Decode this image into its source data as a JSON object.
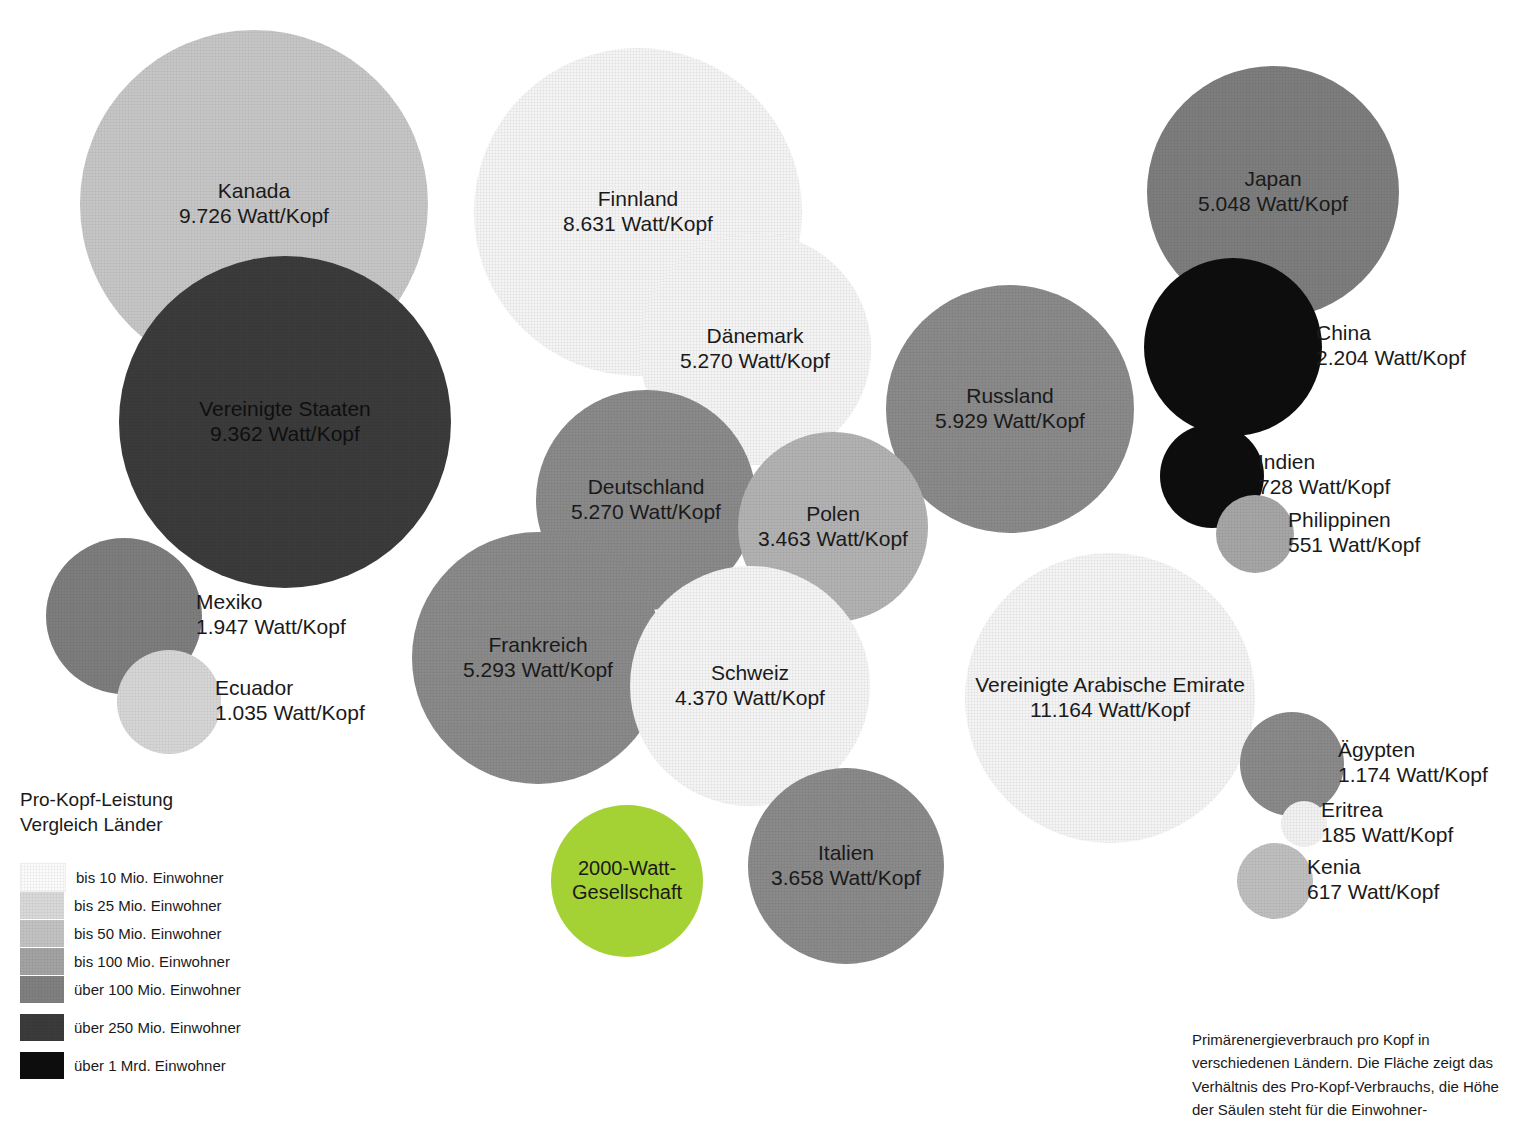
{
  "chart_data": {
    "type": "scatter",
    "title": "Pro-Kopf-Leistung Vergleich Länder",
    "unit_label": "Watt/Kopf",
    "xlabel": "",
    "ylabel": "",
    "grid": false,
    "legend_position": "bottom-left",
    "categories": [
      "Kanada",
      "Finnland",
      "Japan",
      "Vereinigte Staaten",
      "China",
      "Dänemark",
      "Russland",
      "Indien",
      "Deutschland",
      "Polen",
      "Philippinen",
      "Mexiko",
      "Frankreich",
      "Schweiz",
      "Vereinigte Arabische Emirate",
      "Ecuador",
      "Ägypten",
      "Italien",
      "Eritrea",
      "Kenia"
    ],
    "values": [
      9726,
      8631,
      5048,
      9362,
      2204,
      5270,
      5929,
      728,
      5270,
      3463,
      551,
      1947,
      5293,
      4370,
      11164,
      1035,
      1174,
      3658,
      185,
      617
    ],
    "bubbles": [
      {
        "name": "Kanada",
        "value_label": "9.726 Watt/Kopf",
        "value": 9726,
        "population_class": "bis 50 Mio. Einwohner",
        "color": "#c6c6c6",
        "x": 80,
        "y": 30,
        "d": 348,
        "label": "inside",
        "font": 21
      },
      {
        "name": "Finnland",
        "value_label": "8.631 Watt/Kopf",
        "value": 8631,
        "population_class": "bis 10 Mio. Einwohner",
        "color": "#f4f4f4",
        "x": 474,
        "y": 48,
        "d": 328,
        "label": "inside",
        "font": 21
      },
      {
        "name": "Japan",
        "value_label": "5.048 Watt/Kopf",
        "value": 5048,
        "population_class": "über 100 Mio. Einwohner",
        "color": "#7d7d7d",
        "x": 1147,
        "y": 66,
        "d": 252,
        "label": "inside",
        "font": 21
      },
      {
        "name": "Vereinigte Staaten",
        "value_label": "9.362 Watt/Kopf",
        "value": 9362,
        "population_class": "über 250 Mio. Einwohner",
        "color": "#3b3b3b",
        "x": 119,
        "y": 256,
        "d": 332,
        "label": "inside",
        "font": 21,
        "text_color": "#111111"
      },
      {
        "name": "Dänemark",
        "value_label": "5.270 Watt/Kopf",
        "value": 5270,
        "population_class": "bis 10 Mio. Einwohner",
        "color": "#f4f4f4",
        "x": 639,
        "y": 233,
        "d": 232,
        "label": "inside",
        "font": 21
      },
      {
        "name": "China",
        "value_label": "2.204 Watt/Kopf",
        "value": 2204,
        "population_class": "über 1 Mrd. Einwohner",
        "color": "#0d0d0d",
        "x": 1144,
        "y": 258,
        "d": 178,
        "label": "right",
        "font": 21
      },
      {
        "name": "Russland",
        "value_label": "5.929 Watt/Kopf",
        "value": 5929,
        "population_class": "bis 100 Mio. Einwohner",
        "color": "#8a8a8a",
        "x": 886,
        "y": 285,
        "d": 248,
        "label": "inside",
        "font": 21
      },
      {
        "name": "Deutschland",
        "value_label": "5.270 Watt/Kopf",
        "value": 5270,
        "population_class": "bis 100 Mio. Einwohner",
        "color": "#8a8a8a",
        "x": 536,
        "y": 390,
        "d": 220,
        "label": "inside",
        "font": 21
      },
      {
        "name": "Polen",
        "value_label": "3.463 Watt/Kopf",
        "value": 3463,
        "population_class": "bis 50 Mio. Einwohner",
        "color": "#b2b2b2",
        "x": 738,
        "y": 432,
        "d": 190,
        "label": "inside",
        "font": 21
      },
      {
        "name": "Indien",
        "value_label": "728 Watt/Kopf",
        "value": 728,
        "population_class": "über 1 Mrd. Einwohner",
        "color": "#0d0d0d",
        "x": 1160,
        "y": 424,
        "d": 104,
        "label": "right",
        "font": 21
      },
      {
        "name": "Philippinen",
        "value_label": "551 Watt/Kopf",
        "value": 551,
        "population_class": "bis 100 Mio. Einwohner",
        "color": "#a6a6a6",
        "x": 1216,
        "y": 495,
        "d": 78,
        "label": "right",
        "font": 21
      },
      {
        "name": "Mexiko",
        "value_label": "1.947 Watt/Kopf",
        "value": 1947,
        "population_class": "über 100 Mio. Einwohner",
        "color": "#7d7d7d",
        "x": 46,
        "y": 538,
        "d": 156,
        "label": "right",
        "font": 21
      },
      {
        "name": "Frankreich",
        "value_label": "5.293 Watt/Kopf",
        "value": 5293,
        "population_class": "bis 100 Mio. Einwohner",
        "color": "#8a8a8a",
        "x": 412,
        "y": 532,
        "d": 252,
        "label": "inside",
        "font": 21
      },
      {
        "name": "Schweiz",
        "value_label": "4.370 Watt/Kopf",
        "value": 4370,
        "population_class": "bis 10 Mio. Einwohner",
        "color": "#f4f4f4",
        "x": 630,
        "y": 566,
        "d": 240,
        "label": "inside",
        "font": 21
      },
      {
        "name": "Vereinigte Arabische Emirate",
        "value_label": "11.164 Watt/Kopf",
        "value": 11164,
        "population_class": "bis 10 Mio. Einwohner",
        "color": "#f4f4f4",
        "x": 965,
        "y": 553,
        "d": 290,
        "label": "inside",
        "font": 21
      },
      {
        "name": "Ecuador",
        "value_label": "1.035 Watt/Kopf",
        "value": 1035,
        "population_class": "bis 25 Mio. Einwohner",
        "color": "#d6d6d6",
        "x": 117,
        "y": 650,
        "d": 104,
        "label": "right",
        "font": 21
      },
      {
        "name": "Ägypten",
        "value_label": "1.174 Watt/Kopf",
        "value": 1174,
        "population_class": "bis 100 Mio. Einwohner",
        "color": "#8a8a8a",
        "x": 1240,
        "y": 712,
        "d": 104,
        "label": "right",
        "font": 21
      },
      {
        "name": "Italien",
        "value_label": "3.658 Watt/Kopf",
        "value": 3658,
        "population_class": "bis 100 Mio. Einwohner",
        "color": "#8a8a8a",
        "x": 748,
        "y": 768,
        "d": 196,
        "label": "inside",
        "font": 21
      },
      {
        "name": "Eritrea",
        "value_label": "185 Watt/Kopf",
        "value": 185,
        "population_class": "bis 10 Mio. Einwohner",
        "color": "#f2f2f2",
        "x": 1281,
        "y": 801,
        "d": 46,
        "label": "right",
        "font": 21
      },
      {
        "name": "Kenia",
        "value_label": "617 Watt/Kopf",
        "value": 617,
        "population_class": "bis 50 Mio. Einwohner",
        "color": "#bfbfbf",
        "x": 1237,
        "y": 843,
        "d": 76,
        "label": "right",
        "font": 21
      }
    ],
    "highlight": {
      "name": "2000-Watt-",
      "name2": "Gesellschaft",
      "color": "#a4d134",
      "x": 551,
      "y": 805,
      "d": 152
    },
    "annotations": [
      "Primärenergieverbrauch pro Kopf in verschiedenen Ländern. Die Fläche zeigt das Verhältnis des Pro-Kopf-Verbrauchs, die Höhe der Säulen steht für die Einwohner-"
    ]
  },
  "legend": {
    "title_line1": "Pro-Kopf-Leistung",
    "title_line2": "Vergleich Länder",
    "items": [
      {
        "label": "bis 10 Mio. Einwohner",
        "color": "#fbfbfb"
      },
      {
        "label": "bis 25 Mio. Einwohner",
        "color": "#d9d9d9"
      },
      {
        "label": "bis 50 Mio. Einwohner",
        "color": "#c2c2c2"
      },
      {
        "label": "bis 100 Mio. Einwohner",
        "color": "#a3a3a3"
      },
      {
        "label": "über 100 Mio. Einwohner",
        "color": "#808080"
      },
      {
        "label": "über 250 Mio. Einwohner",
        "color": "#3b3b3b"
      },
      {
        "label": "über 1 Mrd. Einwohner",
        "color": "#0d0d0d"
      }
    ]
  },
  "note": {
    "text": "Primärenergieverbrauch pro Kopf in verschiedenen Ländern. Die Fläche zeigt das Verhältnis des Pro-Kopf-Verbrauchs, die Höhe der Säulen steht für die Einwohner-"
  }
}
